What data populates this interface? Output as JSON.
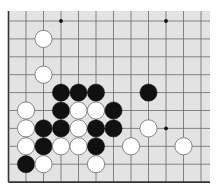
{
  "board": {
    "background": "#e3e3e3",
    "line_color": "#6a6a6a",
    "edge_color": "#333333",
    "columns": 12,
    "rows": 10,
    "origin_x": 8.5,
    "origin_y": 21,
    "spacing_x": 17.5,
    "spacing_y": 17.9,
    "fill": {
      "x": 8,
      "y": 11,
      "width": 202,
      "height": 172
    },
    "edges": {
      "left": true,
      "bottom": true,
      "top": false,
      "right": false
    },
    "stone_radius": 8.6,
    "black_color": "#111111",
    "white_color": "#ffffff",
    "white_stroke": "#777777",
    "star_points": [
      [
        3,
        0
      ],
      [
        9,
        0
      ],
      [
        9,
        6
      ]
    ],
    "stones": [
      {
        "c": 2,
        "r": 1,
        "color": "white"
      },
      {
        "c": 2,
        "r": 3,
        "color": "white"
      },
      {
        "c": 3,
        "r": 4,
        "color": "black"
      },
      {
        "c": 4,
        "r": 4,
        "color": "black"
      },
      {
        "c": 5,
        "r": 4,
        "color": "black"
      },
      {
        "c": 8,
        "r": 4,
        "color": "black"
      },
      {
        "c": 1,
        "r": 5,
        "color": "white"
      },
      {
        "c": 3,
        "r": 5,
        "color": "black"
      },
      {
        "c": 4,
        "r": 5,
        "color": "white"
      },
      {
        "c": 5,
        "r": 5,
        "color": "white"
      },
      {
        "c": 6,
        "r": 5,
        "color": "black"
      },
      {
        "c": 1,
        "r": 6,
        "color": "white"
      },
      {
        "c": 2,
        "r": 6,
        "color": "black"
      },
      {
        "c": 3,
        "r": 6,
        "color": "black"
      },
      {
        "c": 4,
        "r": 6,
        "color": "white"
      },
      {
        "c": 5,
        "r": 6,
        "color": "black"
      },
      {
        "c": 6,
        "r": 6,
        "color": "black"
      },
      {
        "c": 8,
        "r": 6,
        "color": "white"
      },
      {
        "c": 1,
        "r": 7,
        "color": "white"
      },
      {
        "c": 2,
        "r": 7,
        "color": "black"
      },
      {
        "c": 3,
        "r": 7,
        "color": "white"
      },
      {
        "c": 4,
        "r": 7,
        "color": "white"
      },
      {
        "c": 5,
        "r": 7,
        "color": "black"
      },
      {
        "c": 7,
        "r": 7,
        "color": "white"
      },
      {
        "c": 10,
        "r": 7,
        "color": "white"
      },
      {
        "c": 1,
        "r": 8,
        "color": "black"
      },
      {
        "c": 2,
        "r": 8,
        "color": "white"
      },
      {
        "c": 5,
        "r": 8,
        "color": "white"
      }
    ]
  }
}
